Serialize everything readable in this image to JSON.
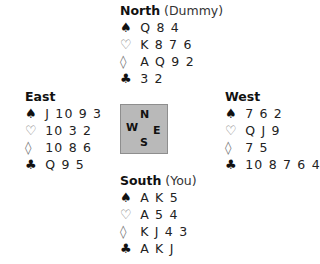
{
  "hands": {
    "north": {
      "name": "North",
      "role": "(Dummy)",
      "spades": "Q 8 4",
      "hearts": "K 8 7 6",
      "diamonds": "A Q 9 2",
      "clubs": "3 2"
    },
    "east": {
      "name": "East",
      "role": "",
      "spades": "J 10 9 3",
      "hearts": "10 3 2",
      "diamonds": "10 8 6",
      "clubs": "Q 9 5"
    },
    "west": {
      "name": "West",
      "role": "",
      "spades": "7 6 2",
      "hearts": "Q J 9",
      "diamonds": "7 5",
      "clubs": "10 8 7 6 4"
    },
    "south": {
      "name": "South",
      "role": "(You)",
      "spades": "A K 5",
      "hearts": "A 5 4",
      "diamonds": "K J 4 3",
      "clubs": "A K J"
    }
  },
  "suits": {
    "spade": "♠",
    "heart": "♡",
    "diamond": "◊",
    "club": "♣"
  },
  "compass": {
    "n": "N",
    "w": "W",
    "e": "E",
    "s": "S",
    "fill": "#b9b9b9"
  }
}
